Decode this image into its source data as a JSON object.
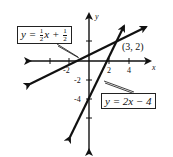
{
  "figure": {
    "axes": {
      "x_label": "x",
      "y_label": "y",
      "x_ticks": [
        "-2",
        "2",
        "4"
      ],
      "y_ticks": [
        "-2",
        "-4"
      ]
    },
    "lines": [
      {
        "name": "line-1",
        "equation_prefix": "y =",
        "frac1_num": "1",
        "frac1_den": "2",
        "mid": "x +",
        "frac2_num": "1",
        "frac2_den": "2"
      },
      {
        "name": "line-2",
        "equation": "y = 2x − 4"
      }
    ],
    "intersection_label": "(3, 2)",
    "colors": {
      "ink": "#111111",
      "background": "#ffffff"
    }
  }
}
